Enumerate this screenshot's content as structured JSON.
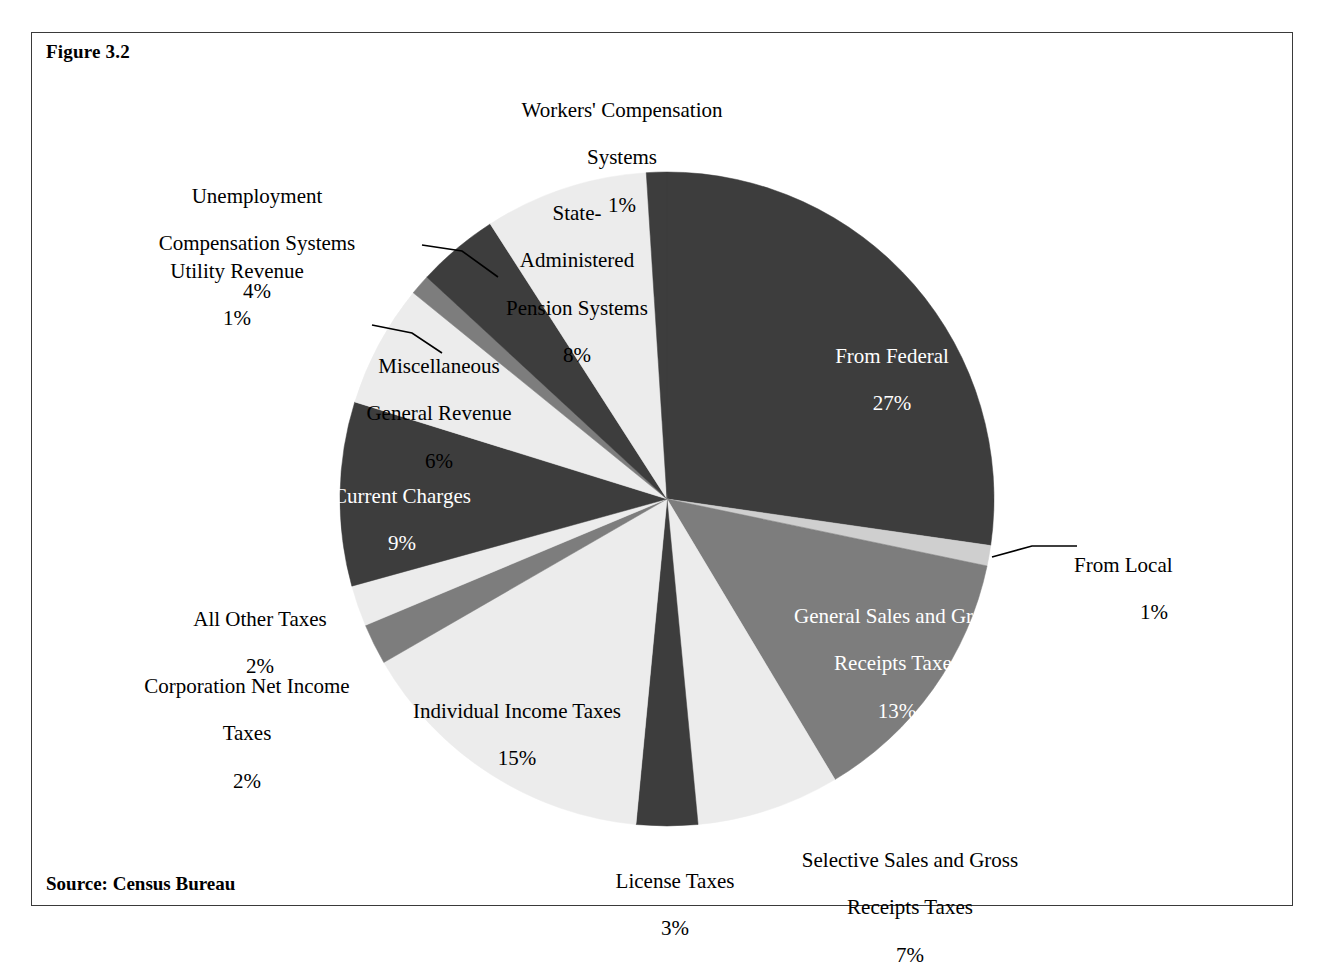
{
  "figure": {
    "number_label": "Figure 3.2",
    "source": "Source: Census Bureau"
  },
  "chart_data": {
    "type": "pie",
    "title": "Figure 3.2",
    "source": "Source: Census Bureau",
    "units": "percent of total state government revenue",
    "total_percent": 100,
    "start_angle_deg": 0,
    "direction": "clockwise",
    "legend": "none (labels placed on/around slices)",
    "colors": {
      "dark": "#3d3d3d",
      "medium": "#7d7d7d",
      "light_gray": "#cfcfcf",
      "light": "#ececec",
      "outline": "#3a3a3a",
      "text": "#000000",
      "text_on_dark": "#ffffff"
    },
    "slices": [
      {
        "label": "From Federal",
        "value": 27,
        "pct_text": "27%",
        "fill": "dark",
        "label_placement": "inside",
        "text_color": "on-dark"
      },
      {
        "label": "From Local",
        "value": 1,
        "pct_text": "1%",
        "fill": "light_gray",
        "label_placement": "outside-leader",
        "text_color": "black"
      },
      {
        "label": "General Sales and Gross Receipts Taxes",
        "value": 13,
        "pct_text": "13%",
        "fill": "medium",
        "label_placement": "inside",
        "text_color": "on-dark"
      },
      {
        "label": "Selective Sales and Gross Receipts Taxes",
        "value": 7,
        "pct_text": "7%",
        "fill": "light",
        "label_placement": "outside",
        "text_color": "black"
      },
      {
        "label": "License Taxes",
        "value": 3,
        "pct_text": "3%",
        "fill": "dark",
        "label_placement": "outside",
        "text_color": "black"
      },
      {
        "label": "Individual Income Taxes",
        "value": 15,
        "pct_text": "15%",
        "fill": "light",
        "label_placement": "inside",
        "text_color": "black"
      },
      {
        "label": "Corporation Net Income Taxes",
        "value": 2,
        "pct_text": "2%",
        "fill": "medium",
        "label_placement": "outside",
        "text_color": "black"
      },
      {
        "label": "All Other Taxes",
        "value": 2,
        "pct_text": "2%",
        "fill": "light",
        "label_placement": "outside",
        "text_color": "black"
      },
      {
        "label": "Current Charges",
        "value": 9,
        "pct_text": "9%",
        "fill": "dark",
        "label_placement": "inside",
        "text_color": "on-dark"
      },
      {
        "label": "Miscellaneous General Revenue",
        "value": 6,
        "pct_text": "6%",
        "fill": "light",
        "label_placement": "inside",
        "text_color": "black"
      },
      {
        "label": "Utility Revenue",
        "value": 1,
        "pct_text": "1%",
        "fill": "medium",
        "label_placement": "outside-leader",
        "text_color": "black"
      },
      {
        "label": "Unemployment Compensation Systems",
        "value": 4,
        "pct_text": "4%",
        "fill": "dark",
        "label_placement": "outside-leader",
        "text_color": "black"
      },
      {
        "label": "State-Administered Pension Systems",
        "value": 8,
        "pct_text": "8%",
        "fill": "light",
        "label_placement": "inside",
        "text_color": "black"
      },
      {
        "label": "Workers' Compensation Systems",
        "value": 1,
        "pct_text": "1%",
        "fill": "dark",
        "label_placement": "outside",
        "text_color": "black"
      }
    ]
  },
  "labels": {
    "workers_comp": {
      "line1": "Workers' Compensation",
      "line2": "Systems",
      "pct": "1%"
    },
    "pension": {
      "line1": "State-",
      "line2": "Administered",
      "line3": "Pension Systems",
      "pct": "8%"
    },
    "unemployment": {
      "line1": "Unemployment",
      "line2": "Compensation Systems",
      "pct": "4%"
    },
    "utility": {
      "line1": "Utility Revenue",
      "pct": "1%"
    },
    "misc_general": {
      "line1": "Miscellaneous",
      "line2": "General Revenue",
      "pct": "6%"
    },
    "current_charges": {
      "line1": "Current Charges",
      "pct": "9%"
    },
    "all_other_taxes": {
      "line1": "All Other Taxes",
      "pct": "2%"
    },
    "corporation_net": {
      "line1": "Corporation Net Income",
      "line2": "Taxes",
      "pct": "2%"
    },
    "individual_income": {
      "line1": "Individual Income Taxes",
      "pct": "15%"
    },
    "license_taxes": {
      "line1": "License Taxes",
      "pct": "3%"
    },
    "selective_sales": {
      "line1": "Selective Sales and Gross",
      "line2": "Receipts Taxes",
      "pct": "7%"
    },
    "general_sales": {
      "line1": "General Sales and Gross",
      "line2": "Receipts Taxes",
      "pct": "13%"
    },
    "from_local": {
      "line1": "From Local",
      "pct": "1%"
    },
    "from_federal": {
      "line1": "From Federal",
      "pct": "27%"
    }
  }
}
